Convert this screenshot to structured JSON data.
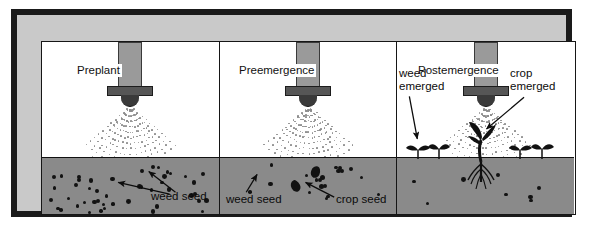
{
  "figure": {
    "colors": {
      "frame_border": "#1a1a1a",
      "frame_fill": "#c9c9c9",
      "panel_background": "#ffffff",
      "soil": "#8a8a8a",
      "spray_dot": "#8d8d8d",
      "seed": "#121212",
      "nozzle_pipe": "#9a9a9a",
      "nozzle_collar": "#565656",
      "nozzle_tip": "#3a3a3a",
      "text": "#0c0c0c"
    }
  },
  "panels": [
    {
      "id": "preplant",
      "caption": "Preplant",
      "icons": {
        "nozzle": "spray-nozzle-icon",
        "spray": "spray-cone-icon"
      },
      "labels": [
        {
          "id": "weed-seed",
          "text": "weed seed",
          "arrows": 2
        }
      ],
      "soil_contents": "many small weed seeds scattered through soil"
    },
    {
      "id": "preemergence",
      "caption": "Preemergence",
      "icons": {
        "nozzle": "spray-nozzle-icon",
        "spray": "spray-cone-icon"
      },
      "labels": [
        {
          "id": "weed-seed",
          "text": "weed seed",
          "arrows": 1
        },
        {
          "id": "crop-seed",
          "text": "crop seed",
          "arrows": 1
        }
      ],
      "soil_contents": "scattered weed seeds plus two larger crop seeds"
    },
    {
      "id": "postemergence",
      "caption": "Postemergence",
      "icons": {
        "nozzle": "spray-nozzle-icon",
        "spray": "spray-cone-icon",
        "weed_plant": "weed-seedling-icon",
        "crop_plant": "crop-seedling-icon"
      },
      "labels": [
        {
          "id": "weed-emerged",
          "text": "weed\nemerged",
          "line1": "weed",
          "line2": "emerged",
          "arrows": 1
        },
        {
          "id": "crop-emerged",
          "text": "crop\nemerged",
          "line1": "crop",
          "line2": "emerged",
          "arrows": 1
        }
      ],
      "soil_contents": "emerged weed seedlings and one larger crop plant with roots"
    }
  ]
}
